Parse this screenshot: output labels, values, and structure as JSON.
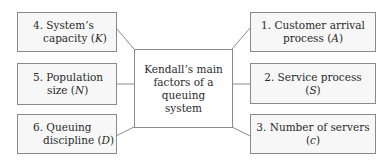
{
  "center": {
    "lines": [
      "Kendall’s main",
      "factors of a",
      "queuing",
      "system"
    ]
  },
  "factors": [
    {
      "number": "1.",
      "lines": [
        "1. Customer arrival",
        "process"
      ],
      "symbol": "A",
      "side": "right"
    },
    {
      "number": "2.",
      "lines": [
        "2. Service process",
        ""
      ],
      "symbol": "S",
      "side": "right"
    },
    {
      "number": "3.",
      "lines": [
        "3. Number of servers",
        ""
      ],
      "symbol": "c",
      "side": "right"
    },
    {
      "number": "4.",
      "lines": [
        "4. System’s",
        "capacity"
      ],
      "symbol": "K",
      "side": "left"
    },
    {
      "number": "5.",
      "lines": [
        "5. Population",
        "size"
      ],
      "symbol": "N",
      "side": "left"
    },
    {
      "number": "6.",
      "lines": [
        "6. Queuing",
        "discipline"
      ],
      "symbol": "D",
      "side": "left"
    }
  ],
  "colors": {
    "border": "#8a8a8a",
    "box_fill": "#f7f7f7",
    "line": "#8a8a8a",
    "text": "#2a2a2a"
  }
}
